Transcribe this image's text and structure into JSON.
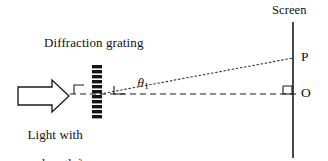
{
  "figure": {
    "title_text": "Diffraction grating",
    "screen_label": "Screen",
    "source_label_line1": "Light with",
    "source_label_line2": "wavelength λ",
    "angle_symbol": "θ",
    "angle_subscript": "1",
    "point_p_label": "P",
    "point_o_label": "O",
    "wavelength_symbol": "λ",
    "colors": {
      "ink": "#111111",
      "line": "#1a1a1a",
      "background": "#ffffff",
      "grating_bar": "#141414"
    },
    "geometry": {
      "canvas_width": 328,
      "canvas_height": 161,
      "axis_y": 94,
      "axis_x_start": 70,
      "axis_x_end": 296,
      "grating_x": 97,
      "grating_top_y": 66,
      "grating_bottom_y": 120,
      "grating_bar_count": 11,
      "grating_bar_width": 10,
      "grating_bar_height": 3.4,
      "screen_x": 293,
      "screen_top_y": 22,
      "screen_bottom_y": 158,
      "ray_start_x": 100,
      "ray_start_y": 94,
      "ray_end_x": 293,
      "ray_end_y": 58,
      "arrow_left_x": 18,
      "arrow_right_x": 69,
      "arrow_center_y": 96
    },
    "line_styles": {
      "axis": "dashed",
      "ray": "dotted",
      "screen": "solid"
    },
    "markers": {
      "right_angle_before_grating": true,
      "right_angle_on_axis": true,
      "right_angle_at_origin": true
    }
  }
}
